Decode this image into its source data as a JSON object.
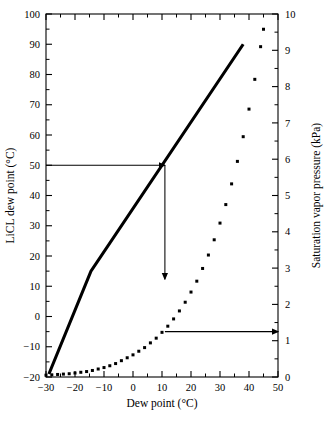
{
  "chart_data": {
    "type": "line",
    "title": "",
    "xlabel": "Dew point (°C)",
    "ylabel": "LiCL dew point (°C)",
    "y2label": "Saturation vapor pressure (kPa)",
    "xlim": [
      -30,
      50
    ],
    "ylim": [
      -20,
      100
    ],
    "y2lim": [
      0,
      10
    ],
    "xticks": [
      "−30",
      "−20",
      "−10",
      "0",
      "10",
      "20",
      "30",
      "40",
      "50"
    ],
    "xtick_values": [
      -30,
      -20,
      -10,
      0,
      10,
      20,
      30,
      40,
      50
    ],
    "yticks": [
      "−20",
      "−10",
      "0",
      "10",
      "20",
      "30",
      "40",
      "50",
      "60",
      "70",
      "80",
      "90",
      "100"
    ],
    "ytick_values": [
      -20,
      -10,
      0,
      10,
      20,
      30,
      40,
      50,
      60,
      70,
      80,
      90,
      100
    ],
    "y2ticks": [
      "0",
      "1",
      "2",
      "3",
      "4",
      "5",
      "6",
      "7",
      "8",
      "9",
      "10"
    ],
    "y2tick_values": [
      0,
      1,
      2,
      3,
      4,
      5,
      6,
      7,
      8,
      9,
      10
    ],
    "grid": false,
    "legend": "none",
    "series": [
      {
        "name": "LiCL dew point",
        "style": "solid-line",
        "axis": "left",
        "color": "#000000",
        "points": [
          [
            -29,
            -19
          ],
          [
            -14.5,
            15
          ],
          [
            38,
            90
          ]
        ]
      },
      {
        "name": "Saturation vapor pressure",
        "style": "dotted-markers",
        "axis": "right",
        "color": "#000000",
        "points": [
          [
            -30,
            0.05
          ],
          [
            -28,
            0.06
          ],
          [
            -26,
            0.07
          ],
          [
            -24,
            0.08
          ],
          [
            -22,
            0.09
          ],
          [
            -20,
            0.11
          ],
          [
            -18,
            0.13
          ],
          [
            -16,
            0.15
          ],
          [
            -14,
            0.18
          ],
          [
            -12,
            0.22
          ],
          [
            -10,
            0.26
          ],
          [
            -8,
            0.31
          ],
          [
            -6,
            0.37
          ],
          [
            -4,
            0.45
          ],
          [
            -2,
            0.53
          ],
          [
            0,
            0.61
          ],
          [
            2,
            0.71
          ],
          [
            4,
            0.81
          ],
          [
            6,
            0.94
          ],
          [
            8,
            1.07
          ],
          [
            10,
            1.23
          ],
          [
            12,
            1.4
          ],
          [
            14,
            1.6
          ],
          [
            16,
            1.82
          ],
          [
            18,
            2.06
          ],
          [
            20,
            2.34
          ],
          [
            22,
            2.64
          ],
          [
            24,
            2.99
          ],
          [
            26,
            3.36
          ],
          [
            28,
            3.78
          ],
          [
            30,
            4.24
          ],
          [
            32,
            4.75
          ],
          [
            34,
            5.32
          ],
          [
            36,
            5.94
          ],
          [
            38,
            6.62
          ],
          [
            40,
            7.38
          ],
          [
            42,
            8.2
          ],
          [
            44,
            9.1
          ],
          [
            45,
            9.58
          ]
        ]
      }
    ],
    "annotations": [
      {
        "name": "left-entry-arrow",
        "type": "arrow",
        "from": [
          -30,
          50
        ],
        "to": [
          11,
          50
        ],
        "axis": "left",
        "description": "horizontal arrow from LiCL dew point 50 to the solid line"
      },
      {
        "name": "down-transfer-arrow",
        "type": "arrow",
        "from": [
          11,
          50
        ],
        "to": [
          11,
          12.3
        ],
        "axis": "left",
        "description": "vertical arrow down from solid line to the dotted curve at dew point 11"
      },
      {
        "name": "right-exit-arrow",
        "type": "arrow",
        "from": [
          11,
          1.25
        ],
        "to": [
          50,
          1.25
        ],
        "axis": "right",
        "description": "horizontal arrow from the dotted curve out to saturation vapor pressure axis"
      }
    ]
  }
}
